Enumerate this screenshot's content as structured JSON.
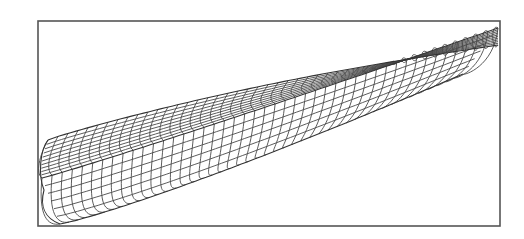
{
  "figure": {
    "frame": {
      "x": 38,
      "y": 21,
      "width": 462,
      "height": 205
    },
    "colors": {
      "background": "#ffffff",
      "frame": "#555555",
      "lines": "#4a4a4a"
    },
    "hull": {
      "stern": {
        "x": 42,
        "deck_y": 150,
        "keel_y": 224
      },
      "bow": {
        "x": 498,
        "y": 24
      },
      "section_count": 46,
      "waterline_count": 9
    }
  }
}
